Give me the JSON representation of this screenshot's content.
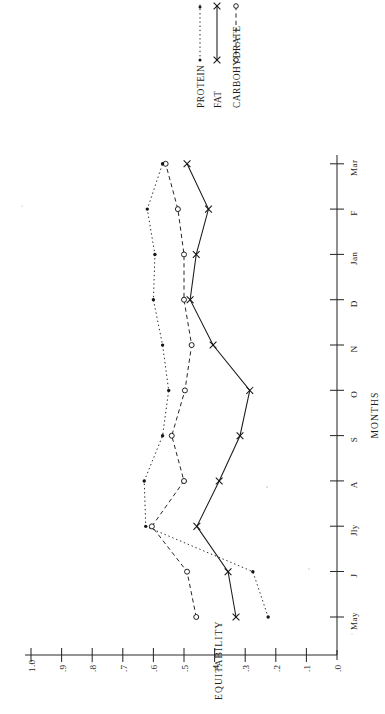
{
  "chart_data": {
    "type": "line",
    "title": "",
    "orientation": "rotated-90-clockwise",
    "xlabel": "MONTHS",
    "ylabel": "EQUITABILITY",
    "categories": [
      "May",
      "J",
      "Jly",
      "A",
      "S",
      "O",
      "N",
      "D",
      "Jan",
      "F",
      "Mar"
    ],
    "x_tick_labels": [
      "May",
      "J",
      "Jly",
      "A",
      "S",
      "O",
      "N",
      "D",
      "Jan",
      "F",
      "Mar"
    ],
    "y_tick_labels": [
      ".0",
      ".1",
      ".2",
      ".3",
      ".4",
      ".5",
      ".6",
      ".7",
      ".8",
      ".9",
      "1.0"
    ],
    "y_tick_values": [
      0.0,
      0.1,
      0.2,
      0.3,
      0.4,
      0.5,
      0.6,
      0.7,
      0.8,
      0.9,
      1.0
    ],
    "ylim": [
      0.0,
      1.0
    ],
    "grid": false,
    "legend_position": "top-right",
    "series": [
      {
        "name": "PROTEIN",
        "marker": "filled-dot",
        "linestyle": "dotted",
        "values": [
          0.225,
          0.275,
          0.625,
          0.63,
          0.57,
          0.55,
          0.57,
          0.6,
          0.595,
          0.62,
          0.57
        ]
      },
      {
        "name": "FAT",
        "marker": "x",
        "linestyle": "solid",
        "values": [
          0.33,
          0.356,
          0.458,
          0.385,
          0.317,
          0.285,
          0.405,
          0.48,
          0.46,
          0.42,
          0.49
        ]
      },
      {
        "name": "CARBOHYDRATE",
        "marker": "open-circle",
        "linestyle": "dashed",
        "values": [
          0.46,
          0.49,
          0.605,
          0.5,
          0.54,
          0.497,
          0.475,
          0.5,
          0.5,
          0.52,
          0.56
        ]
      }
    ]
  },
  "legend": {
    "items": [
      {
        "label": "PROTEIN"
      },
      {
        "label": "FAT"
      },
      {
        "label": "CARBOHYDRATE"
      }
    ]
  },
  "axes": {
    "x_title": "MONTHS",
    "y_title": "EQUITABILITY"
  },
  "y_ticks": {
    "t0": ".0",
    "t1": ".1",
    "t2": ".2",
    "t3": ".3",
    "t4": ".4",
    "t5": ".5",
    "t6": ".6",
    "t7": ".7",
    "t8": ".8",
    "t9": ".9",
    "t10": "1.0"
  },
  "x_ticks": {
    "m0": "May",
    "m1": "J",
    "m2": "Jly",
    "m3": "A",
    "m4": "S",
    "m5": "O",
    "m6": "N",
    "m7": "D",
    "m8": "Jan",
    "m9": "F",
    "m10": "Mar"
  }
}
